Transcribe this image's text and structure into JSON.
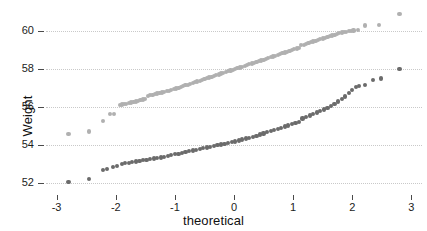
{
  "chart_data": {
    "type": "scatter",
    "title": "",
    "subtitle": "",
    "xlabel": "theoretical",
    "ylabel": "Weight",
    "xlim": [
      -3.18,
      3.18
    ],
    "ylim": [
      51.6,
      61.2
    ],
    "xticks": [
      -3,
      -2,
      -1,
      0,
      1,
      2,
      3
    ],
    "xticklabels": [
      "-3",
      "-2",
      "-1",
      "0",
      "1",
      "2",
      "3"
    ],
    "yticks": [
      52,
      54,
      56,
      58,
      60
    ],
    "yticklabels": [
      "52",
      "54",
      "56",
      "58",
      "60"
    ],
    "grid": "horizontal-dotted",
    "legend": "none",
    "series": [
      {
        "name": "upper-light-series",
        "color": "#b0b0b0",
        "points": [
          [
            -2.8,
            54.6
          ],
          [
            -2.45,
            54.72
          ],
          [
            -2.22,
            55.28
          ],
          [
            -2.1,
            55.62
          ],
          [
            -2.03,
            55.65
          ],
          [
            -1.93,
            56.12
          ],
          [
            -1.9,
            56.14
          ],
          [
            -1.86,
            56.16
          ],
          [
            -1.82,
            56.18
          ],
          [
            -1.78,
            56.2
          ],
          [
            -1.74,
            56.24
          ],
          [
            -1.7,
            56.27
          ],
          [
            -1.66,
            56.3
          ],
          [
            -1.62,
            56.33
          ],
          [
            -1.58,
            56.36
          ],
          [
            -1.54,
            56.4
          ],
          [
            -1.5,
            56.44
          ],
          [
            -1.46,
            56.58
          ],
          [
            -1.42,
            56.62
          ],
          [
            -1.38,
            56.65
          ],
          [
            -1.34,
            56.68
          ],
          [
            -1.3,
            56.71
          ],
          [
            -1.26,
            56.74
          ],
          [
            -1.22,
            56.77
          ],
          [
            -1.18,
            56.8
          ],
          [
            -1.14,
            56.83
          ],
          [
            -1.1,
            56.86
          ],
          [
            -1.06,
            56.9
          ],
          [
            -1.02,
            56.94
          ],
          [
            -0.98,
            56.98
          ],
          [
            -0.94,
            57.02
          ],
          [
            -0.9,
            57.06
          ],
          [
            -0.86,
            57.1
          ],
          [
            -0.82,
            57.14
          ],
          [
            -0.78,
            57.18
          ],
          [
            -0.74,
            57.22
          ],
          [
            -0.7,
            57.26
          ],
          [
            -0.66,
            57.3
          ],
          [
            -0.62,
            57.34
          ],
          [
            -0.58,
            57.38
          ],
          [
            -0.54,
            57.43
          ],
          [
            -0.5,
            57.47
          ],
          [
            -0.46,
            57.51
          ],
          [
            -0.42,
            57.55
          ],
          [
            -0.38,
            57.59
          ],
          [
            -0.34,
            57.63
          ],
          [
            -0.3,
            57.67
          ],
          [
            -0.26,
            57.71
          ],
          [
            -0.22,
            57.76
          ],
          [
            -0.18,
            57.8
          ],
          [
            -0.14,
            57.84
          ],
          [
            -0.1,
            57.88
          ],
          [
            -0.06,
            57.92
          ],
          [
            -0.02,
            57.96
          ],
          [
            0.02,
            58.0
          ],
          [
            0.06,
            58.04
          ],
          [
            0.1,
            58.08
          ],
          [
            0.14,
            58.12
          ],
          [
            0.18,
            58.16
          ],
          [
            0.22,
            58.21
          ],
          [
            0.26,
            58.25
          ],
          [
            0.3,
            58.29
          ],
          [
            0.34,
            58.33
          ],
          [
            0.38,
            58.37
          ],
          [
            0.42,
            58.41
          ],
          [
            0.46,
            58.45
          ],
          [
            0.5,
            58.49
          ],
          [
            0.54,
            58.53
          ],
          [
            0.58,
            58.58
          ],
          [
            0.62,
            58.62
          ],
          [
            0.66,
            58.66
          ],
          [
            0.7,
            58.7
          ],
          [
            0.74,
            58.74
          ],
          [
            0.78,
            58.78
          ],
          [
            0.82,
            58.83
          ],
          [
            0.86,
            58.87
          ],
          [
            0.9,
            58.91
          ],
          [
            0.94,
            58.95
          ],
          [
            0.98,
            58.99
          ],
          [
            1.02,
            59.04
          ],
          [
            1.06,
            59.08
          ],
          [
            1.1,
            59.12
          ],
          [
            1.14,
            59.24
          ],
          [
            1.18,
            59.28
          ],
          [
            1.22,
            59.32
          ],
          [
            1.26,
            59.36
          ],
          [
            1.3,
            59.4
          ],
          [
            1.34,
            59.44
          ],
          [
            1.38,
            59.48
          ],
          [
            1.42,
            59.52
          ],
          [
            1.46,
            59.56
          ],
          [
            1.5,
            59.6
          ],
          [
            1.54,
            59.64
          ],
          [
            1.58,
            59.68
          ],
          [
            1.62,
            59.72
          ],
          [
            1.66,
            59.76
          ],
          [
            1.7,
            59.8
          ],
          [
            1.74,
            59.84
          ],
          [
            1.78,
            59.88
          ],
          [
            1.82,
            59.91
          ],
          [
            1.86,
            59.94
          ],
          [
            1.9,
            59.96
          ],
          [
            1.94,
            59.98
          ],
          [
            1.98,
            60.0
          ],
          [
            2.02,
            60.02
          ],
          [
            2.1,
            60.06
          ],
          [
            2.22,
            60.28
          ],
          [
            2.45,
            60.3
          ],
          [
            2.8,
            60.88
          ]
        ]
      },
      {
        "name": "lower-dark-series",
        "color": "#6b6b6b",
        "points": [
          [
            -2.8,
            52.08
          ],
          [
            -2.45,
            52.22
          ],
          [
            -2.22,
            52.7
          ],
          [
            -2.15,
            52.76
          ],
          [
            -2.05,
            52.88
          ],
          [
            -1.98,
            52.9
          ],
          [
            -1.9,
            53.02
          ],
          [
            -1.84,
            53.06
          ],
          [
            -1.78,
            53.09
          ],
          [
            -1.72,
            53.12
          ],
          [
            -1.66,
            53.15
          ],
          [
            -1.6,
            53.18
          ],
          [
            -1.54,
            53.21
          ],
          [
            -1.48,
            53.24
          ],
          [
            -1.42,
            53.27
          ],
          [
            -1.36,
            53.3
          ],
          [
            -1.3,
            53.33
          ],
          [
            -1.24,
            53.36
          ],
          [
            -1.18,
            53.4
          ],
          [
            -1.12,
            53.44
          ],
          [
            -1.06,
            53.48
          ],
          [
            -1.0,
            53.52
          ],
          [
            -0.94,
            53.56
          ],
          [
            -0.88,
            53.6
          ],
          [
            -0.82,
            53.64
          ],
          [
            -0.76,
            53.68
          ],
          [
            -0.7,
            53.72
          ],
          [
            -0.64,
            53.76
          ],
          [
            -0.58,
            53.8
          ],
          [
            -0.52,
            53.84
          ],
          [
            -0.46,
            53.88
          ],
          [
            -0.4,
            53.92
          ],
          [
            -0.34,
            53.96
          ],
          [
            -0.28,
            54.0
          ],
          [
            -0.22,
            54.04
          ],
          [
            -0.16,
            54.08
          ],
          [
            -0.1,
            54.12
          ],
          [
            -0.04,
            54.16
          ],
          [
            0.02,
            54.2
          ],
          [
            0.08,
            54.25
          ],
          [
            0.14,
            54.3
          ],
          [
            0.2,
            54.35
          ],
          [
            0.26,
            54.4
          ],
          [
            0.32,
            54.45
          ],
          [
            0.38,
            54.5
          ],
          [
            0.44,
            54.56
          ],
          [
            0.5,
            54.62
          ],
          [
            0.56,
            54.68
          ],
          [
            0.62,
            54.74
          ],
          [
            0.68,
            54.8
          ],
          [
            0.74,
            54.86
          ],
          [
            0.8,
            54.92
          ],
          [
            0.86,
            54.98
          ],
          [
            0.92,
            55.04
          ],
          [
            0.98,
            55.1
          ],
          [
            1.04,
            55.16
          ],
          [
            1.1,
            55.22
          ],
          [
            1.16,
            55.4
          ],
          [
            1.22,
            55.48
          ],
          [
            1.28,
            55.56
          ],
          [
            1.34,
            55.64
          ],
          [
            1.4,
            55.72
          ],
          [
            1.46,
            55.8
          ],
          [
            1.52,
            55.88
          ],
          [
            1.58,
            55.96
          ],
          [
            1.64,
            56.08
          ],
          [
            1.7,
            56.18
          ],
          [
            1.76,
            56.3
          ],
          [
            1.82,
            56.42
          ],
          [
            1.88,
            56.56
          ],
          [
            1.94,
            56.72
          ],
          [
            2.0,
            56.9
          ],
          [
            2.06,
            57.04
          ],
          [
            2.12,
            57.12
          ],
          [
            2.22,
            57.14
          ],
          [
            2.35,
            57.42
          ],
          [
            2.48,
            57.5
          ],
          [
            2.8,
            58.0
          ]
        ]
      }
    ]
  },
  "axes": {
    "ylabel_text": "Weight",
    "xlabel_text": "theoretical"
  }
}
